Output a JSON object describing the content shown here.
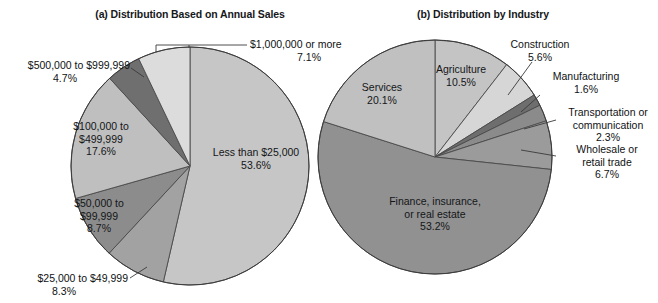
{
  "figure": {
    "cropped_top_title": "Characteristics of Women-Owned Businesses",
    "width": 658,
    "height": 303,
    "background": "#ffffff"
  },
  "panels": {
    "a": {
      "title": "(a) Distribution Based on Annual Sales"
    },
    "b": {
      "title": "(b) Distribution by Industry"
    }
  },
  "chart_data": [
    {
      "type": "pie",
      "id": "a",
      "title": "(a) Distribution Based on Annual Sales",
      "xlabel": "",
      "ylabel": "",
      "units": "percent",
      "legend": "none (direct slice labels)",
      "grid": false,
      "start_angle_deg": 0,
      "direction": "clockwise",
      "categories": [
        "Less than $25,000",
        "$25,000 to $49,999",
        "$50,000 to $99,999",
        "$100,000 to $499,999",
        "$500,000 to $999,999",
        "$1,000,000 or more"
      ],
      "values": [
        53.6,
        8.3,
        8.7,
        17.6,
        4.7,
        7.1
      ],
      "value_labels": [
        "53.6%",
        "8.3%",
        "8.7%",
        "17.6%",
        "4.7%",
        "7.1%"
      ],
      "colors": [
        "#c6c6c6",
        "#a2a2a2",
        "#8c8c8c",
        "#bfbfbf",
        "#6f6f6f",
        "#dcdcdc"
      ],
      "slices": [
        {
          "label": "Less than $25,000",
          "pct": 53.6,
          "pct_text": "53.6%",
          "color": "#c6c6c6",
          "label_position": "inside"
        },
        {
          "label": "$25,000 to $49,999",
          "pct": 8.3,
          "pct_text": "8.3%",
          "color": "#a2a2a2",
          "label_position": "outside-bottom-left"
        },
        {
          "label": "$50,000 to $99,999",
          "pct": 8.7,
          "pct_text": "8.7%",
          "color": "#8c8c8c",
          "label_position": "inside"
        },
        {
          "label": "$100,000 to $499,999",
          "pct": 17.6,
          "pct_text": "17.6%",
          "color": "#bfbfbf",
          "label_position": "inside"
        },
        {
          "label": "$500,000 to $999,999",
          "pct": 4.7,
          "pct_text": "4.7%",
          "color": "#6f6f6f",
          "label_position": "outside-left"
        },
        {
          "label": "$1,000,000 or more",
          "pct": 7.1,
          "pct_text": "7.1%",
          "color": "#dcdcdc",
          "label_position": "outside-top-right"
        }
      ]
    },
    {
      "type": "pie",
      "id": "b",
      "title": "(b) Distribution by Industry",
      "xlabel": "",
      "ylabel": "",
      "units": "percent",
      "legend": "none (direct slice labels)",
      "grid": false,
      "start_angle_deg": 0,
      "direction": "clockwise",
      "categories": [
        "Agriculture",
        "Construction",
        "Manufacturing",
        "Transportation or communication",
        "Wholesale or retail trade",
        "Finance, insurance, or real estate",
        "Services"
      ],
      "values": [
        10.5,
        5.6,
        1.6,
        2.3,
        6.7,
        53.2,
        20.1
      ],
      "value_labels": [
        "10.5%",
        "5.6%",
        "1.6%",
        "2.3%",
        "6.7%",
        "53.2%",
        "20.1%"
      ],
      "colors": [
        "#c4c4c4",
        "#d6d6d6",
        "#6e6e6e",
        "#8b8b8b",
        "#9b9b9b",
        "#919191",
        "#c0c0c0"
      ],
      "slices": [
        {
          "label": "Agriculture",
          "pct": 10.5,
          "pct_text": "10.5%",
          "color": "#c4c4c4",
          "label_position": "inside"
        },
        {
          "label": "Construction",
          "pct": 5.6,
          "pct_text": "5.6%",
          "color": "#d6d6d6",
          "label_position": "outside-right"
        },
        {
          "label": "Manufacturing",
          "pct": 1.6,
          "pct_text": "1.6%",
          "color": "#6e6e6e",
          "label_position": "outside-right"
        },
        {
          "label": "Transportation or communication",
          "pct": 2.3,
          "pct_text": "2.3%",
          "color": "#8b8b8b",
          "label_position": "outside-right"
        },
        {
          "label": "Wholesale or retail trade",
          "pct": 6.7,
          "pct_text": "6.7%",
          "color": "#9b9b9b",
          "label_position": "outside-right"
        },
        {
          "label": "Finance, insurance, or real estate",
          "pct": 53.2,
          "pct_text": "53.2%",
          "color": "#919191",
          "label_position": "inside"
        },
        {
          "label": "Services",
          "pct": 20.1,
          "pct_text": "20.1%",
          "color": "#c0c0c0",
          "label_position": "inside"
        }
      ]
    }
  ],
  "labels_a": {
    "million_or_more": {
      "name": "$1,000,000 or more",
      "pct": "7.1%"
    },
    "five_hundred_k": {
      "name_line1": "$500,000 to $999,999",
      "pct": "4.7%"
    },
    "hundred_k": {
      "name_line1": "$100,000 to",
      "name_line2": "$499,999",
      "pct": "17.6%"
    },
    "fifty_k": {
      "name_line1": "$50,000 to",
      "name_line2": "$99,999",
      "pct": "8.7%"
    },
    "twentyfive_k": {
      "name_line1": "$25,000 to $49,999",
      "pct": "8.3%"
    },
    "less_than_25k": {
      "name_line1": "Less than $25,000",
      "pct": "53.6%"
    }
  },
  "labels_b": {
    "services": {
      "name": "Services",
      "pct": "20.1%"
    },
    "agriculture": {
      "name": "Agriculture",
      "pct": "10.5%"
    },
    "construction": {
      "name": "Construction",
      "pct": "5.6%"
    },
    "manufacturing": {
      "name": "Manufacturing",
      "pct": "1.6%"
    },
    "transportation": {
      "name_line1": "Transportation or",
      "name_line2": "communication",
      "pct": "2.3%"
    },
    "wholesale": {
      "name_line1": "Wholesale or",
      "name_line2": "retail trade",
      "pct": "6.7%"
    },
    "finance": {
      "name_line1": "Finance, insurance,",
      "name_line2": "or real estate",
      "pct": "53.2%"
    }
  }
}
